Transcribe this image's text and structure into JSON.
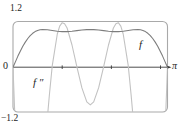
{
  "figure": {
    "y_max_label": "1.2",
    "origin_label": "0",
    "y_min_label": "−1.2",
    "x_max_label": "π",
    "curve_f_label": "f",
    "curve_fpp_label": "f ″"
  },
  "colors": {
    "background": "#ffffff",
    "window_box": "#a9a9a9",
    "axis": "#3a3a3a",
    "text": "#1d1d1d",
    "curve_f": "#7d7d7d",
    "curve_f_second": "#c2c2c2"
  },
  "chart_data": {
    "type": "line",
    "title": "",
    "xlabel": "",
    "ylabel": "",
    "xlim": [
      0,
      3.1416
    ],
    "ylim": [
      -1.2,
      1.2
    ],
    "x_axis_end_label": "π",
    "y_tick_labels": [
      "1.2",
      "0",
      "−1.2"
    ],
    "x_ticks": [
      1,
      2,
      3
    ],
    "grid": false,
    "legend": "inline-curve-labels",
    "series": [
      {
        "name": "f ″",
        "label": "f ″",
        "color_key": "curve_f_second",
        "data_name": "f-second-derivative-curve",
        "points": [
          [
            0,
            0
          ],
          [
            0.02,
            -0.7
          ],
          [
            0.04,
            -1.39
          ],
          [
            0.06,
            -2.06
          ],
          [
            0.1,
            -3.34
          ],
          [
            0.15,
            -4.72
          ],
          [
            0.2,
            -5.78
          ],
          [
            0.3,
            -6.81
          ],
          [
            0.4,
            -6.41
          ],
          [
            0.5,
            -4.98
          ],
          [
            0.6,
            -3.12
          ],
          [
            0.7,
            -1.33
          ],
          [
            0.74,
            -0.73
          ],
          [
            0.8,
            0.05
          ],
          [
            0.9,
            0.88
          ],
          [
            0.95,
            1.09
          ],
          [
            1.0,
            1.18
          ],
          [
            1.05,
            1.15
          ],
          [
            1.1,
            1.04
          ],
          [
            1.2,
            0.59
          ],
          [
            1.3,
            0.01
          ],
          [
            1.4,
            -0.55
          ],
          [
            1.5,
            -0.92
          ],
          [
            1.5708,
            -1.0
          ],
          [
            1.6416,
            -0.92
          ],
          [
            1.7416,
            -0.55
          ],
          [
            1.8416,
            0.01
          ],
          [
            1.9416,
            0.59
          ],
          [
            2.0416,
            1.04
          ],
          [
            2.0916,
            1.15
          ],
          [
            2.1416,
            1.18
          ],
          [
            2.1916,
            1.09
          ],
          [
            2.2416,
            0.88
          ],
          [
            2.3416,
            0.05
          ],
          [
            2.4016,
            -0.73
          ],
          [
            2.4416,
            -1.33
          ],
          [
            2.5416,
            -3.12
          ],
          [
            2.6416,
            -4.98
          ],
          [
            2.7416,
            -6.41
          ],
          [
            2.8416,
            -6.81
          ],
          [
            2.9416,
            -5.78
          ],
          [
            2.9916,
            -4.72
          ],
          [
            3.0416,
            -3.34
          ],
          [
            3.0816,
            -2.06
          ],
          [
            3.1016,
            -1.39
          ],
          [
            3.1216,
            -0.7
          ],
          [
            3.1416,
            0
          ]
        ]
      },
      {
        "name": "f",
        "label": "f",
        "color_key": "curve_f",
        "data_name": "f-curve",
        "points": [
          [
            0,
            0
          ],
          [
            0.05,
            0.149
          ],
          [
            0.1,
            0.294
          ],
          [
            0.15,
            0.431
          ],
          [
            0.2,
            0.556
          ],
          [
            0.25,
            0.666
          ],
          [
            0.3,
            0.761
          ],
          [
            0.35,
            0.838
          ],
          [
            0.4,
            0.899
          ],
          [
            0.45,
            0.944
          ],
          [
            0.5,
            0.974
          ],
          [
            0.55,
            0.992
          ],
          [
            0.6,
            0.999
          ],
          [
            0.7,
            0.993
          ],
          [
            0.8,
            0.974
          ],
          [
            0.9,
            0.954
          ],
          [
            1.0,
            0.944
          ],
          [
            1.1,
            0.944
          ],
          [
            1.2,
            0.954
          ],
          [
            1.3,
            0.97
          ],
          [
            1.4,
            0.987
          ],
          [
            1.5,
            0.998
          ],
          [
            1.5708,
            1.0
          ],
          [
            1.6416,
            0.998
          ],
          [
            1.7416,
            0.987
          ],
          [
            1.8416,
            0.97
          ],
          [
            1.9416,
            0.954
          ],
          [
            2.0416,
            0.944
          ],
          [
            2.1416,
            0.944
          ],
          [
            2.2416,
            0.954
          ],
          [
            2.3416,
            0.974
          ],
          [
            2.4416,
            0.993
          ],
          [
            2.5416,
            0.999
          ],
          [
            2.5916,
            0.992
          ],
          [
            2.6416,
            0.974
          ],
          [
            2.6916,
            0.944
          ],
          [
            2.7416,
            0.899
          ],
          [
            2.7916,
            0.838
          ],
          [
            2.8416,
            0.761
          ],
          [
            2.8916,
            0.666
          ],
          [
            2.9416,
            0.556
          ],
          [
            2.9916,
            0.431
          ],
          [
            3.0416,
            0.294
          ],
          [
            3.0916,
            0.149
          ],
          [
            3.1416,
            0
          ]
        ]
      }
    ]
  }
}
